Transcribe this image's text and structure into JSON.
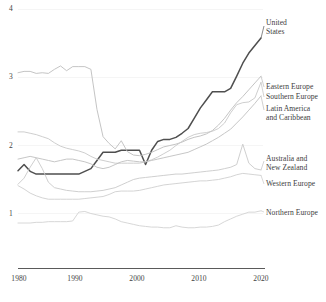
{
  "chart_data": {
    "type": "line",
    "title": "",
    "subtitle": "",
    "xlabel": "",
    "ylabel": "",
    "xlim": [
      1980,
      2020
    ],
    "ylim": [
      0.55,
      4.0
    ],
    "grid": true,
    "grid_axis": "y",
    "legend_position": "right-inline-labels",
    "y_ticks": [
      "1",
      "2",
      "3",
      "4"
    ],
    "y_tick_values": [
      1,
      2,
      3,
      4
    ],
    "x_ticks": [
      "1980",
      "1990",
      "2000",
      "2010",
      "2020"
    ],
    "x_tick_values": [
      1980,
      1990,
      2000,
      2010,
      2020
    ],
    "x": [
      1980,
      1981,
      1982,
      1983,
      1984,
      1985,
      1986,
      1987,
      1988,
      1989,
      1990,
      1991,
      1992,
      1993,
      1994,
      1995,
      1996,
      1997,
      1998,
      1999,
      2000,
      2001,
      2002,
      2003,
      2004,
      2005,
      2006,
      2007,
      2008,
      2009,
      2010,
      2011,
      2012,
      2013,
      2014,
      2015,
      2016,
      2017,
      2018,
      2019,
      2020
    ],
    "series": [
      {
        "name": "United States",
        "label": "United States",
        "color": "#4f4f4f",
        "width": 1.5,
        "emphasis": true,
        "values": [
          1.63,
          1.72,
          1.62,
          1.58,
          1.58,
          1.58,
          1.58,
          1.58,
          1.58,
          1.58,
          1.58,
          1.62,
          1.66,
          1.78,
          1.9,
          1.9,
          1.9,
          1.93,
          1.93,
          1.93,
          1.93,
          1.72,
          1.93,
          2.06,
          2.09,
          2.09,
          2.12,
          2.18,
          2.25,
          2.4,
          2.55,
          2.67,
          2.79,
          2.79,
          2.79,
          2.84,
          3.02,
          3.21,
          3.36,
          3.47,
          3.58
        ]
      },
      {
        "name": "Eastern Europe",
        "label": "Eastern Europe",
        "color": "#bdbdbd",
        "width": 0.9,
        "emphasis": false,
        "values": [
          3.07,
          3.09,
          3.09,
          3.06,
          3.07,
          3.06,
          3.12,
          3.17,
          3.1,
          3.16,
          3.16,
          3.16,
          3.12,
          2.53,
          2.13,
          2.03,
          1.95,
          2.07,
          1.91,
          1.86,
          1.85,
          1.87,
          1.9,
          1.94,
          1.98,
          2.0,
          2.02,
          2.05,
          2.09,
          2.12,
          2.14,
          2.17,
          2.22,
          2.3,
          2.4,
          2.52,
          2.63,
          2.72,
          2.82,
          2.92,
          3.02
        ]
      },
      {
        "name": "Southern Europe",
        "label": "Southern Europe",
        "color": "#c8c8c8",
        "width": 0.9,
        "emphasis": false,
        "values": [
          2.2,
          2.2,
          2.18,
          2.16,
          2.13,
          2.1,
          2.04,
          1.99,
          1.96,
          1.94,
          1.92,
          1.89,
          1.84,
          1.8,
          1.78,
          1.76,
          1.74,
          1.74,
          1.74,
          1.74,
          1.74,
          1.76,
          1.79,
          1.83,
          1.88,
          1.93,
          2.0,
          2.06,
          2.12,
          2.16,
          2.18,
          2.19,
          2.21,
          2.25,
          2.33,
          2.48,
          2.6,
          2.63,
          2.64,
          2.7,
          2.93
        ]
      },
      {
        "name": "Latin America and Caribbean",
        "label": "Latin America and Caribbean",
        "color": "#c0c0c0",
        "width": 0.9,
        "emphasis": false,
        "values": [
          1.8,
          1.82,
          1.84,
          1.82,
          1.8,
          1.78,
          1.76,
          1.78,
          1.8,
          1.8,
          1.78,
          1.76,
          1.73,
          1.68,
          1.66,
          1.68,
          1.72,
          1.76,
          1.78,
          1.77,
          1.76,
          1.76,
          1.78,
          1.8,
          1.82,
          1.84,
          1.86,
          1.88,
          1.9,
          1.94,
          1.98,
          2.02,
          2.07,
          2.12,
          2.18,
          2.24,
          2.33,
          2.42,
          2.52,
          2.62,
          2.73
        ]
      },
      {
        "name": "Australia and New Zealand",
        "label": "Australia and New Zealand",
        "color": "#c9c9c9",
        "width": 0.9,
        "emphasis": false,
        "values": [
          1.43,
          1.52,
          1.68,
          1.82,
          1.66,
          1.46,
          1.38,
          1.36,
          1.34,
          1.33,
          1.32,
          1.32,
          1.32,
          1.33,
          1.34,
          1.36,
          1.38,
          1.42,
          1.46,
          1.5,
          1.52,
          1.53,
          1.54,
          1.55,
          1.56,
          1.57,
          1.58,
          1.58,
          1.59,
          1.6,
          1.61,
          1.62,
          1.63,
          1.64,
          1.66,
          1.68,
          1.72,
          2.02,
          1.74,
          1.66,
          1.64
        ]
      },
      {
        "name": "Western Europe",
        "label": "Western Europe",
        "color": "#cfcfcf",
        "width": 0.9,
        "emphasis": false,
        "values": [
          1.41,
          1.36,
          1.3,
          1.26,
          1.23,
          1.21,
          1.21,
          1.21,
          1.21,
          1.21,
          1.21,
          1.22,
          1.23,
          1.24,
          1.25,
          1.28,
          1.32,
          1.33,
          1.33,
          1.33,
          1.34,
          1.36,
          1.38,
          1.4,
          1.42,
          1.43,
          1.44,
          1.45,
          1.46,
          1.47,
          1.48,
          1.48,
          1.49,
          1.5,
          1.52,
          1.54,
          1.57,
          1.59,
          1.58,
          1.57,
          1.56
        ]
      },
      {
        "name": "Northern Europe",
        "label": "Northern Europe",
        "color": "#d2d2d2",
        "width": 0.9,
        "emphasis": false,
        "values": [
          0.86,
          0.86,
          0.86,
          0.87,
          0.87,
          0.88,
          0.88,
          0.88,
          0.88,
          0.89,
          1.02,
          1.03,
          1.0,
          0.98,
          0.96,
          0.95,
          0.92,
          0.88,
          0.86,
          0.84,
          0.82,
          0.81,
          0.8,
          0.8,
          0.79,
          0.79,
          0.82,
          0.8,
          0.79,
          0.79,
          0.8,
          0.8,
          0.81,
          0.83,
          0.88,
          0.92,
          0.96,
          0.99,
          1.02,
          1.02,
          1.04
        ]
      }
    ],
    "annotations": [
      {
        "name": "united-states",
        "text_lines": [
          "United",
          "States"
        ]
      },
      {
        "name": "eastern-europe",
        "text_lines": [
          "Eastern Europe"
        ]
      },
      {
        "name": "southern-europe",
        "text_lines": [
          "Southern Europe"
        ]
      },
      {
        "name": "latin-america-and-caribbean",
        "text_lines": [
          "Latin America",
          "and Caribbean"
        ]
      },
      {
        "name": "australia-and-new-zealand",
        "text_lines": [
          "Australia and",
          "New Zealand"
        ]
      },
      {
        "name": "western-europe",
        "text_lines": [
          "Western Europe"
        ]
      },
      {
        "name": "northern-europe",
        "text_lines": [
          "Northern Europe"
        ]
      }
    ]
  },
  "axes": {
    "y_tick_1": "1",
    "y_tick_2": "2",
    "y_tick_3": "3",
    "y_tick_4": "4",
    "x_tick_1980": "1980",
    "x_tick_1990": "1990",
    "x_tick_2000": "2000",
    "x_tick_2010": "2010",
    "x_tick_2020": "2020"
  },
  "labels": {
    "united_states_line1": "United",
    "united_states_line2": "States",
    "eastern_europe": "Eastern Europe",
    "southern_europe": "Southern Europe",
    "latin_america_line1": "Latin America",
    "latin_america_line2": "and Caribbean",
    "australia_line1": "Australia and",
    "australia_line2": "New Zealand",
    "western_europe": "Western Europe",
    "northern_europe": "Northern Europe"
  },
  "colors": {
    "axis": "#555555",
    "grid": "#f2f2f2",
    "emphasis_line": "#4f4f4f",
    "muted_line": "#c8c8c8",
    "text": "#3d3d3d",
    "background": "#ffffff"
  }
}
